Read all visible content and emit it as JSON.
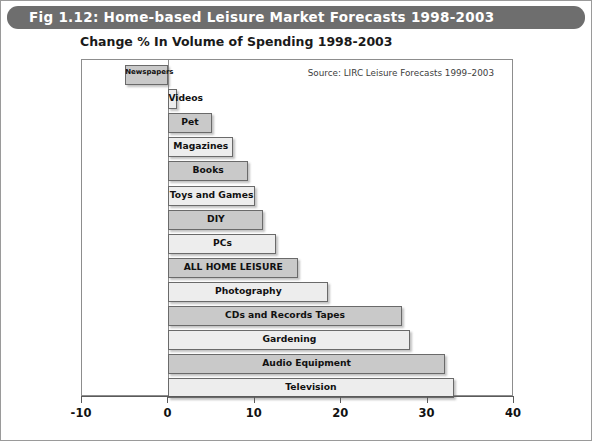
{
  "figure": {
    "title": "Fig 1.12: Home-based Leisure Market Forecasts 1998-2003",
    "title_bar_color": "#6e6e6e",
    "border_color": "#9a9a9a"
  },
  "chart_data": {
    "type": "bar",
    "orientation": "horizontal",
    "title": "Change % In Volume of Spending 1998-2003",
    "subtitle": "Change % In Volume of Spending 1998-2003",
    "source": "Source: LIRC Leisure Forecasts 1999–2003",
    "xlabel": "",
    "ylabel": "",
    "xlim": [
      -10,
      40
    ],
    "xticks": [
      -10,
      0,
      10,
      20,
      30,
      40
    ],
    "xtick_labels": [
      "-10",
      "0",
      "10",
      "20",
      "30",
      "40"
    ],
    "grid": false,
    "legend": false,
    "bar_colors": {
      "dark": "#c9c9c9",
      "light": "#ededed",
      "border": "#6a6a6a"
    },
    "categories": [
      "Newspapers",
      "Videos",
      "Pet",
      "Magazines",
      "Books",
      "Toys and Games",
      "DIY",
      "PCs",
      "ALL HOME LEISURE",
      "Photography",
      "CDs and Records Tapes",
      "Gardening",
      "Audio Equipment",
      "Television"
    ],
    "values": [
      -5,
      1,
      5,
      7.5,
      9.2,
      10,
      11,
      12.5,
      15,
      18.5,
      27,
      28,
      32,
      33
    ],
    "bars": [
      {
        "label": "Newspapers",
        "value": -5,
        "shade": "dark",
        "label_size": "tiny"
      },
      {
        "label": "Videos",
        "value": 1,
        "shade": "light",
        "label_size": "normal"
      },
      {
        "label": "Pet",
        "value": 5,
        "shade": "dark",
        "label_size": "normal"
      },
      {
        "label": "Magazines",
        "value": 7.5,
        "shade": "light",
        "label_size": "normal"
      },
      {
        "label": "Books",
        "value": 9.2,
        "shade": "dark",
        "label_size": "normal"
      },
      {
        "label": "Toys and Games",
        "value": 10,
        "shade": "light",
        "label_size": "normal"
      },
      {
        "label": "DIY",
        "value": 11,
        "shade": "dark",
        "label_size": "normal"
      },
      {
        "label": "PCs",
        "value": 12.5,
        "shade": "light",
        "label_size": "normal"
      },
      {
        "label": "ALL HOME LEISURE",
        "value": 15,
        "shade": "dark",
        "label_size": "normal"
      },
      {
        "label": "Photography",
        "value": 18.5,
        "shade": "light",
        "label_size": "normal"
      },
      {
        "label": "CDs and Records Tapes",
        "value": 27,
        "shade": "dark",
        "label_size": "normal"
      },
      {
        "label": "Gardening",
        "value": 28,
        "shade": "light",
        "label_size": "normal"
      },
      {
        "label": "Audio Equipment",
        "value": 32,
        "shade": "dark",
        "label_size": "normal"
      },
      {
        "label": "Television",
        "value": 33,
        "shade": "light",
        "label_size": "normal"
      }
    ]
  }
}
